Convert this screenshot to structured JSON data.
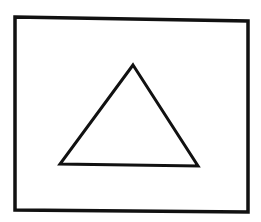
{
  "canvas": {
    "width": 261,
    "height": 222,
    "background": "#ffffff"
  },
  "stroke": {
    "color": "#111111",
    "rect_width": 3.5,
    "triangle_width": 3
  },
  "shapes": {
    "rectangle": {
      "points": [
        [
          15,
          17
        ],
        [
          248,
          21
        ],
        [
          248,
          212
        ],
        [
          15,
          210
        ]
      ]
    },
    "triangle": {
      "points": [
        [
          133,
          65
        ],
        [
          198,
          166
        ],
        [
          60,
          164
        ]
      ]
    }
  }
}
